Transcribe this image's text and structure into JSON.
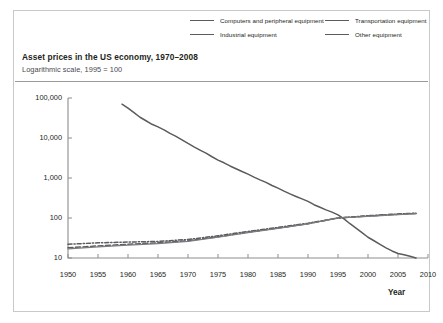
{
  "figure": {
    "title": "Asset prices in the US economy, 1970–2008",
    "subtitle": "Logarithmic scale, 1995 = 100",
    "xaxis_title": "Year",
    "frame_color": "#c8c9cb",
    "line_color": "#5b5b5f",
    "text_color": "#231f20"
  },
  "legend": {
    "items": [
      {
        "label": "Computers and peripheral equipment",
        "style": "solid"
      },
      {
        "label": "Industrial equipment",
        "style": "dashed"
      },
      {
        "label": "Transportation equipment",
        "style": "dash-dot"
      },
      {
        "label": "Other equipment",
        "style": "thin-solid"
      }
    ]
  },
  "chart_data": {
    "type": "line",
    "title": "Asset prices in the US economy, 1970–2008",
    "subtitle": "Logarithmic scale, 1995 = 100",
    "xlabel": "Year",
    "ylabel": "",
    "yscale": "log",
    "ylim": [
      10,
      100000
    ],
    "xlim": [
      1950,
      2010
    ],
    "ytick_labels": [
      "10",
      "100",
      "1,000",
      "10,000",
      "100,000"
    ],
    "yticks": [
      10,
      100,
      1000,
      10000,
      100000
    ],
    "xticks": [
      1950,
      1955,
      1960,
      1965,
      1970,
      1975,
      1980,
      1985,
      1990,
      1995,
      2000,
      2005,
      2010
    ],
    "grid": false,
    "legend_position": "top",
    "series": [
      {
        "name": "Computers and peripheral equipment",
        "style": "solid",
        "x": [
          1959,
          1960,
          1961,
          1962,
          1963,
          1964,
          1965,
          1966,
          1967,
          1968,
          1969,
          1970,
          1971,
          1972,
          1973,
          1974,
          1975,
          1976,
          1977,
          1978,
          1979,
          1980,
          1981,
          1982,
          1983,
          1984,
          1985,
          1986,
          1987,
          1988,
          1989,
          1990,
          1991,
          1992,
          1993,
          1994,
          1995,
          1996,
          1997,
          1998,
          1999,
          2000,
          2001,
          2002,
          2003,
          2004,
          2005,
          2006,
          2007,
          2008
        ],
        "y": [
          70000,
          56000,
          43000,
          33000,
          27000,
          22000,
          19000,
          16000,
          13000,
          11000,
          9000,
          7300,
          6000,
          5000,
          4200,
          3400,
          2800,
          2400,
          2000,
          1700,
          1450,
          1250,
          1050,
          900,
          780,
          650,
          560,
          470,
          400,
          345,
          300,
          260,
          215,
          185,
          160,
          140,
          120,
          95,
          72,
          56,
          43,
          33,
          27,
          22,
          18,
          15,
          13,
          12,
          11,
          10
        ]
      },
      {
        "name": "Industrial equipment",
        "style": "dashed",
        "x": [
          1950,
          1955,
          1960,
          1965,
          1970,
          1975,
          1980,
          1985,
          1990,
          1995,
          2000,
          2005,
          2008
        ],
        "y": [
          18,
          20,
          22,
          24,
          27,
          34,
          44,
          56,
          72,
          100,
          112,
          124,
          130
        ]
      },
      {
        "name": "Transportation equipment",
        "style": "dash-dot",
        "x": [
          1950,
          1955,
          1960,
          1965,
          1970,
          1975,
          1980,
          1985,
          1990,
          1995,
          2000,
          2005,
          2008
        ],
        "y": [
          22,
          24,
          25,
          26,
          29,
          36,
          46,
          58,
          74,
          100,
          114,
          126,
          132
        ]
      },
      {
        "name": "Other equipment",
        "style": "thin-solid",
        "x": [
          1950,
          1955,
          1960,
          1965,
          1970,
          1975,
          1980,
          1985,
          1990,
          1995,
          2000,
          2005,
          2008
        ],
        "y": [
          17,
          19,
          21,
          23,
          26,
          33,
          43,
          55,
          71,
          100,
          110,
          122,
          128
        ]
      }
    ]
  }
}
